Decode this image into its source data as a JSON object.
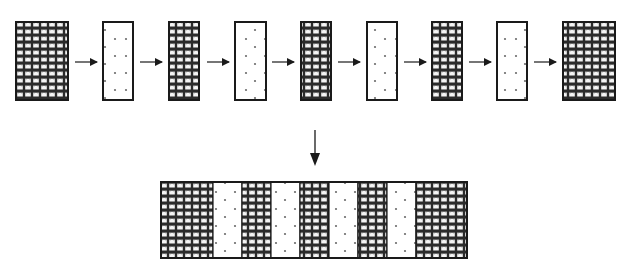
{
  "diagram": {
    "type": "layer-stacking-process",
    "colors": {
      "stroke": "#1a1a1a",
      "pattern_fill_dark": "#2b2b2b",
      "pattern_fill_light": "#ffffff",
      "dot_fill": "#ffffff",
      "dot_color": "#6b6b6b",
      "arrow": "#1a1a1a"
    },
    "top_row": {
      "y_top": 22,
      "y_bottom": 100,
      "items": [
        {
          "kind": "layer",
          "fill": "pattern",
          "x": 16,
          "w": 52
        },
        {
          "kind": "arrow",
          "direction": "right",
          "x1": 75,
          "x2": 97
        },
        {
          "kind": "layer",
          "fill": "dots",
          "x": 103,
          "w": 30
        },
        {
          "kind": "arrow",
          "direction": "right",
          "x1": 140,
          "x2": 162
        },
        {
          "kind": "layer",
          "fill": "pattern",
          "x": 169,
          "w": 30
        },
        {
          "kind": "arrow",
          "direction": "right",
          "x1": 207,
          "x2": 229
        },
        {
          "kind": "layer",
          "fill": "dots",
          "x": 235,
          "w": 31
        },
        {
          "kind": "arrow",
          "direction": "right",
          "x1": 272,
          "x2": 294
        },
        {
          "kind": "layer",
          "fill": "pattern",
          "x": 301,
          "w": 30
        },
        {
          "kind": "arrow",
          "direction": "right",
          "x1": 338,
          "x2": 360
        },
        {
          "kind": "layer",
          "fill": "dots",
          "x": 367,
          "w": 30
        },
        {
          "kind": "arrow",
          "direction": "right",
          "x1": 404,
          "x2": 426
        },
        {
          "kind": "layer",
          "fill": "pattern",
          "x": 432,
          "w": 30
        },
        {
          "kind": "arrow",
          "direction": "right",
          "x1": 469,
          "x2": 491
        },
        {
          "kind": "layer",
          "fill": "dots",
          "x": 497,
          "w": 30
        },
        {
          "kind": "arrow",
          "direction": "right",
          "x1": 534,
          "x2": 556
        },
        {
          "kind": "layer",
          "fill": "pattern",
          "x": 563,
          "w": 52
        }
      ]
    },
    "down_arrow": {
      "x": 315,
      "y1": 130,
      "y2": 166
    },
    "combined_strip": {
      "x": 161,
      "y_top": 182,
      "y_bottom": 258,
      "segments": [
        {
          "fill": "pattern",
          "x": 161,
          "w": 52
        },
        {
          "fill": "dots",
          "x": 213,
          "w": 29
        },
        {
          "fill": "pattern",
          "x": 242,
          "w": 29
        },
        {
          "fill": "dots",
          "x": 271,
          "w": 29
        },
        {
          "fill": "pattern",
          "x": 300,
          "w": 29
        },
        {
          "fill": "dots",
          "x": 329,
          "w": 29
        },
        {
          "fill": "pattern",
          "x": 358,
          "w": 29
        },
        {
          "fill": "dots",
          "x": 387,
          "w": 29
        },
        {
          "fill": "pattern",
          "x": 416,
          "w": 51
        }
      ]
    },
    "labels": {
      "title": "Sequential layer stacking into combined laminate",
      "top_row": "Individual layers in sequence",
      "bottom": "Combined laminated strip"
    }
  }
}
